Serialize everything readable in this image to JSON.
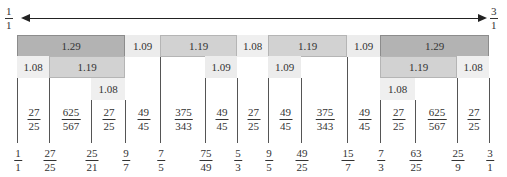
{
  "axis": {
    "start_label": {
      "num": "1",
      "den": "1"
    },
    "end_label": {
      "num": "3",
      "den": "1"
    }
  },
  "ticks": [
    {
      "x": 17,
      "num": "1",
      "den": "1"
    },
    {
      "x": 49,
      "num": "27",
      "den": "25"
    },
    {
      "x": 91,
      "num": "25",
      "den": "21"
    },
    {
      "x": 125,
      "num": "9",
      "den": "7"
    },
    {
      "x": 160,
      "num": "7",
      "den": "5"
    },
    {
      "x": 205,
      "num": "75",
      "den": "49"
    },
    {
      "x": 237,
      "num": "5",
      "den": "3"
    },
    {
      "x": 268,
      "num": "9",
      "den": "5"
    },
    {
      "x": 301,
      "num": "49",
      "den": "25"
    },
    {
      "x": 347,
      "num": "15",
      "den": "7"
    },
    {
      "x": 380,
      "num": "7",
      "den": "3"
    },
    {
      "x": 415,
      "num": "63",
      "den": "25"
    },
    {
      "x": 457,
      "num": "25",
      "den": "9"
    },
    {
      "x": 489,
      "num": "3",
      "den": "1"
    }
  ],
  "intervals": [
    {
      "num": "27",
      "den": "25"
    },
    {
      "num": "625",
      "den": "567"
    },
    {
      "num": "27",
      "den": "25"
    },
    {
      "num": "49",
      "den": "45"
    },
    {
      "num": "375",
      "den": "343"
    },
    {
      "num": "49",
      "den": "45"
    },
    {
      "num": "27",
      "den": "25"
    },
    {
      "num": "49",
      "den": "45"
    },
    {
      "num": "375",
      "den": "343"
    },
    {
      "num": "49",
      "den": "45"
    },
    {
      "num": "27",
      "den": "25"
    },
    {
      "num": "625",
      "den": "567"
    },
    {
      "num": "27",
      "den": "25"
    }
  ],
  "rows": [
    [
      {
        "x0": 17,
        "x1": 125,
        "label": "1.29",
        "level": "129"
      },
      {
        "x0": 125,
        "x1": 160,
        "label": "1.09",
        "level": "109"
      },
      {
        "x0": 160,
        "x1": 237,
        "label": "1.19",
        "level": "119"
      },
      {
        "x0": 237,
        "x1": 268,
        "label": "1.08",
        "level": "108"
      },
      {
        "x0": 268,
        "x1": 347,
        "label": "1.19",
        "level": "119"
      },
      {
        "x0": 347,
        "x1": 380,
        "label": "1.09",
        "level": "109"
      },
      {
        "x0": 380,
        "x1": 489,
        "label": "1.29",
        "level": "129"
      }
    ],
    [
      {
        "x0": 17,
        "x1": 49,
        "label": "1.08",
        "level": "108"
      },
      {
        "x0": 49,
        "x1": 125,
        "label": "1.19",
        "level": "119"
      },
      {
        "x0": 205,
        "x1": 237,
        "label": "1.09",
        "level": "109"
      },
      {
        "x0": 268,
        "x1": 301,
        "label": "1.09",
        "level": "109"
      },
      {
        "x0": 380,
        "x1": 457,
        "label": "1.19",
        "level": "119"
      },
      {
        "x0": 457,
        "x1": 489,
        "label": "1.08",
        "level": "108"
      }
    ],
    [
      {
        "x0": 91,
        "x1": 125,
        "label": "1.08",
        "level": "108"
      },
      {
        "x0": 380,
        "x1": 415,
        "label": "1.08",
        "level": "108"
      }
    ]
  ]
}
